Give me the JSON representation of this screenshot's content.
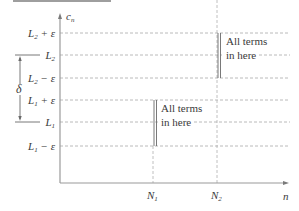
{
  "diagram": {
    "y_axis_label": "c",
    "y_axis_label_sub": "n",
    "x_axis_label": "n",
    "levels": [
      {
        "id": "L2_plus_eps",
        "base": "L",
        "sub": "2",
        "suffix": " + ε",
        "y": 33
      },
      {
        "id": "L2",
        "base": "L",
        "sub": "2",
        "suffix": "",
        "y": 55
      },
      {
        "id": "L2_minus_eps",
        "base": "L",
        "sub": "2",
        "suffix": " − ε",
        "y": 78
      },
      {
        "id": "L1_plus_eps",
        "base": "L",
        "sub": "1",
        "suffix": " + ε",
        "y": 100
      },
      {
        "id": "L1",
        "base": "L",
        "sub": "1",
        "suffix": "",
        "y": 122
      },
      {
        "id": "L1_minus_eps",
        "base": "L",
        "sub": "1",
        "suffix": " − ε",
        "y": 146
      }
    ],
    "x_ticks": [
      {
        "id": "N1",
        "base": "N",
        "sub": "1",
        "x": 153
      },
      {
        "id": "N2",
        "base": "N",
        "sub": "2",
        "x": 217
      }
    ],
    "delta_label": "δ",
    "annotations": [
      {
        "id": "band-L1",
        "line1": "All terms",
        "line2": "in here"
      },
      {
        "id": "band-L2",
        "line1": "All terms",
        "line2": "in here"
      }
    ],
    "colors": {
      "axis": "#9a9a9a",
      "dash": "#a8a8a8",
      "text": "#3a3a3a",
      "header_bar": "#9e9e9e"
    }
  }
}
